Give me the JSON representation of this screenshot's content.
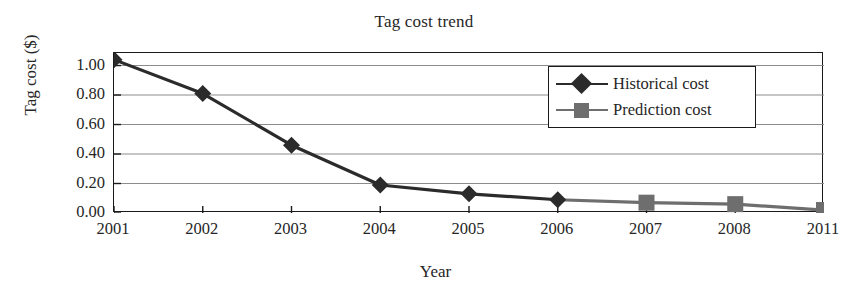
{
  "chart_data": {
    "type": "line",
    "title": "Tag cost trend",
    "xlabel": "Year",
    "ylabel": "Tag cost ($)",
    "categories": [
      "2001",
      "2002",
      "2003",
      "2004",
      "2005",
      "2006",
      "2007",
      "2008",
      "2011"
    ],
    "ylim": [
      0.0,
      1.0
    ],
    "yticks": [
      "0.00",
      "0.20",
      "0.40",
      "0.60",
      "0.80",
      "1.00"
    ],
    "ytick_values": [
      0.0,
      0.2,
      0.4,
      0.6,
      0.8,
      1.0
    ],
    "grid": "horizontal",
    "legend_position": "upper-right-inside",
    "series": [
      {
        "name": "Historical cost",
        "marker": "diamond",
        "color": "#2b2b2b",
        "x": [
          "2001",
          "2002",
          "2003",
          "2004",
          "2005",
          "2006"
        ],
        "values": [
          1.04,
          0.81,
          0.46,
          0.19,
          0.13,
          0.09
        ]
      },
      {
        "name": "Prediction cost",
        "marker": "square",
        "color": "#6e6e6e",
        "x": [
          "2006",
          "2007",
          "2008",
          "2011"
        ],
        "values": [
          0.09,
          0.07,
          0.06,
          0.02
        ]
      }
    ]
  },
  "colors": {
    "historical": "#2b2b2b",
    "prediction": "#6e6e6e",
    "frame": "#1a1a1a",
    "grid": "#8c8c8c",
    "background": "#ffffff",
    "text": "#262626"
  },
  "legend": {
    "items": [
      {
        "label": "Historical cost",
        "icon": "diamond-marker-icon"
      },
      {
        "label": "Prediction cost",
        "icon": "square-marker-icon"
      }
    ]
  }
}
